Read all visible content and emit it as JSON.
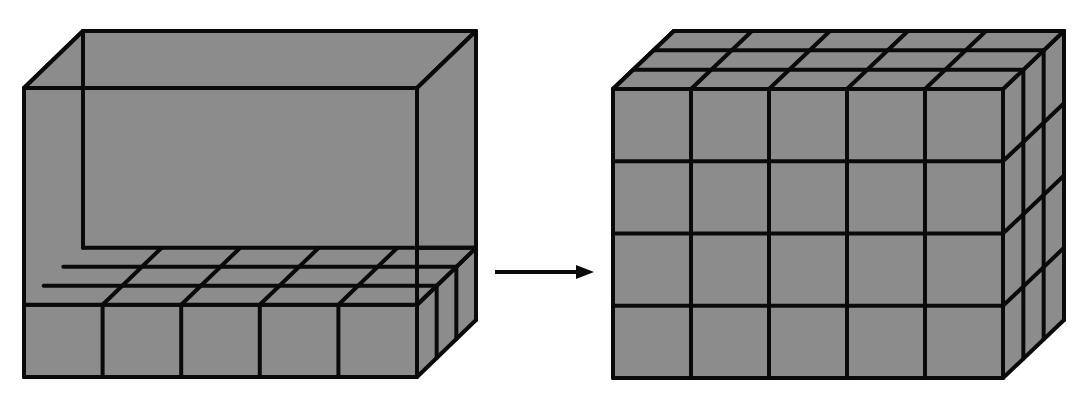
{
  "figure": {
    "fill_color": "#8c8c8c",
    "line_color": "#0a0a0a",
    "background": "#ffffff"
  },
  "left_box": {
    "label": "Box with one layer of unit cubes",
    "front": {
      "x0": 24,
      "y0": 88,
      "x1": 417,
      "y1": 377
    },
    "depth_offset": {
      "dx": 59,
      "dy": -57
    },
    "cubes_wide": 5,
    "cubes_deep": 3,
    "layers_filled": 1,
    "layers_total": 4
  },
  "arrow": {
    "label": "leads to",
    "x0": 495,
    "y": 272,
    "x1": 594
  },
  "right_box": {
    "label": "Box completely filled with unit cubes",
    "front": {
      "x0": 613,
      "y0": 89,
      "x1": 1003,
      "y1": 378
    },
    "depth_offset": {
      "dx": 61,
      "dy": -58
    },
    "cubes_wide": 5,
    "cubes_deep": 3,
    "layers_filled": 4,
    "layers_total": 4
  }
}
